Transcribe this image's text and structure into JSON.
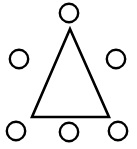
{
  "canvas": {
    "width": 137,
    "height": 149,
    "background_color": "#ffffff",
    "stroke_color": "#000000"
  },
  "figure": {
    "name": "triangle-surrounded-by-six-circles"
  },
  "chart_data": {
    "type": "scatter",
    "title": "",
    "xlabel": "",
    "ylabel": "",
    "xlim": [
      0,
      137
    ],
    "ylim": [
      0,
      149
    ],
    "grid": false,
    "legend": null,
    "shapes": [
      {
        "id": "triangle",
        "kind": "triangle",
        "fill": "#ffffff",
        "stroke": "#000000",
        "stroke_width": 2.6,
        "points": [
          [
            70,
            29
          ],
          [
            32,
            117
          ],
          [
            109,
            117
          ]
        ]
      }
    ],
    "series": [
      {
        "name": "circles",
        "marker": "open-circle",
        "marker_radius": 9.2,
        "fill": "#ffffff",
        "stroke": "#000000",
        "stroke_width": 2.4,
        "points": [
          {
            "label": "top",
            "x": 69,
            "y": 13
          },
          {
            "label": "left-middle",
            "x": 19,
            "y": 59
          },
          {
            "label": "right-middle",
            "x": 116,
            "y": 59
          },
          {
            "label": "bottom-left",
            "x": 16,
            "y": 131
          },
          {
            "label": "bottom-center",
            "x": 69,
            "y": 132
          },
          {
            "label": "bottom-right",
            "x": 118,
            "y": 131
          }
        ]
      }
    ]
  }
}
